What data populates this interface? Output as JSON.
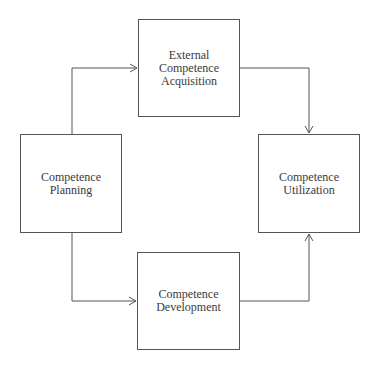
{
  "diagram": {
    "nodes": [
      {
        "id": "ext",
        "lines": [
          "External Competence",
          "Acquisition"
        ]
      },
      {
        "id": "plan",
        "lines": [
          "Competence",
          "Planning"
        ]
      },
      {
        "id": "util",
        "lines": [
          "Competence",
          "Utilization"
        ]
      },
      {
        "id": "dev",
        "lines": [
          "Competence",
          "Development"
        ]
      }
    ],
    "edges": [
      {
        "from": "plan",
        "to": "ext"
      },
      {
        "from": "ext",
        "to": "util"
      },
      {
        "from": "plan",
        "to": "dev"
      },
      {
        "from": "dev",
        "to": "util"
      }
    ],
    "colors": {
      "line": "#555555",
      "text": "#3a3a3a",
      "background": "#ffffff"
    }
  }
}
